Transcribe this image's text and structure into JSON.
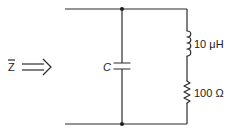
{
  "diagram": {
    "type": "circuit-schematic",
    "input": {
      "symbol": "Z",
      "overbar": true,
      "arrow": "double-arrow-right"
    },
    "components": [
      {
        "id": "capacitor",
        "kind": "capacitor",
        "label": "C",
        "placement": "shunt-left"
      },
      {
        "id": "inductor",
        "kind": "inductor",
        "label": "10 μH",
        "placement": "right-branch-top"
      },
      {
        "id": "resistor",
        "kind": "resistor",
        "label": "100 Ω",
        "placement": "right-branch-bottom"
      }
    ],
    "topology": "C in parallel with series (L + R)",
    "colors": {
      "line": "#2a2a2a",
      "background": "#ffffff"
    }
  }
}
